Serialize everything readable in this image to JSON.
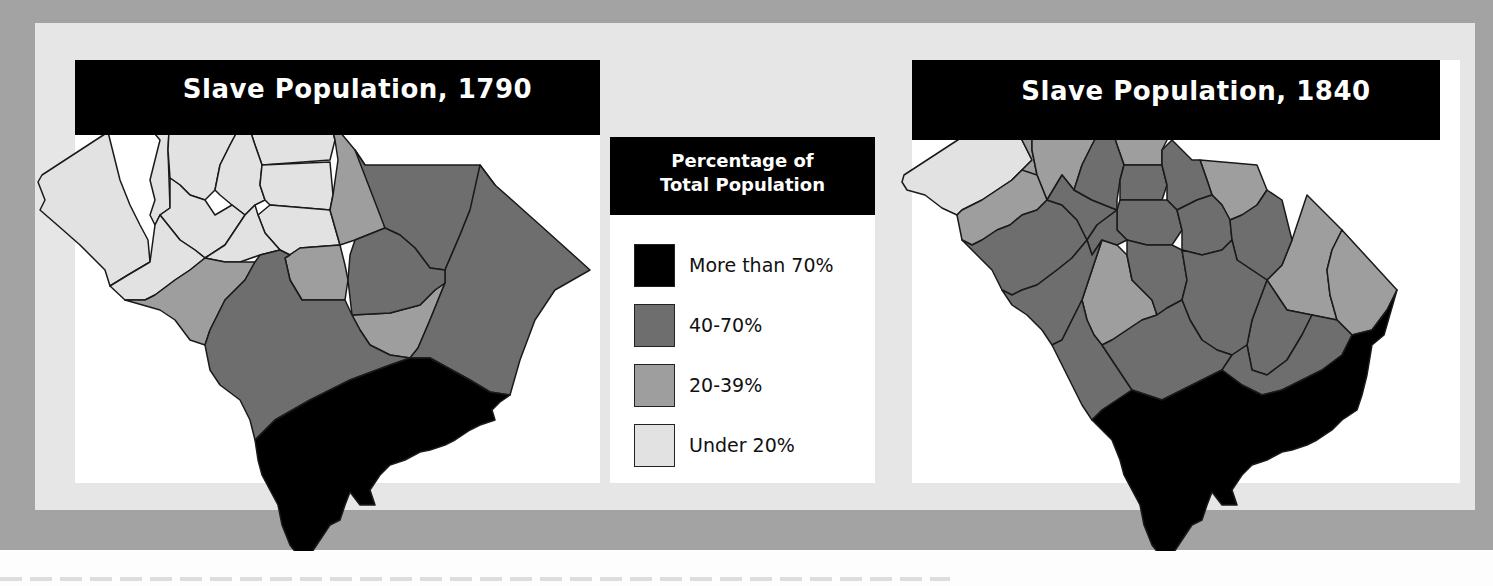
{
  "maps": [
    {
      "id": "1790",
      "title": "Slave Population, 1790",
      "year": 1790
    },
    {
      "id": "1840",
      "title": "Slave Population, 1840",
      "year": 1840
    }
  ],
  "legend": {
    "title_line1": "Percentage of",
    "title_line2": "Total Population",
    "items": [
      {
        "label": "More than 70%",
        "color": "#000000"
      },
      {
        "label": "40-70%",
        "color": "#6e6e6e"
      },
      {
        "label": "20-39%",
        "color": "#9e9e9e"
      },
      {
        "label": "Under 20%",
        "color": "#e2e2e2"
      }
    ]
  },
  "colors": {
    "outer_border": "#a3a3a3",
    "inner_panel": "#e6e6e6",
    "panel_bg": "#ffffff",
    "title_bg": "#000000",
    "title_text": "#ffffff",
    "county_line": "#1a1a1a"
  }
}
